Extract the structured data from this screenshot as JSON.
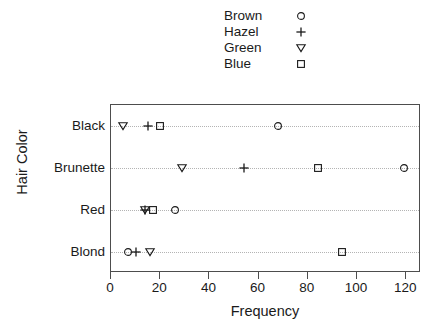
{
  "chart_data": {
    "type": "scatter",
    "title": "",
    "xlabel": "Frequency",
    "ylabel": "Hair Color",
    "xlim": [
      0,
      126
    ],
    "ylim_categories": [
      "Blond",
      "Red",
      "Brunette",
      "Black"
    ],
    "categories": [
      "Black",
      "Brunette",
      "Red",
      "Blond"
    ],
    "xticks": [
      0,
      20,
      40,
      60,
      80,
      100,
      120
    ],
    "grid": "dotted-horizontal",
    "legend_position": "top-center",
    "series": [
      {
        "name": "Brown",
        "marker": "circle",
        "values": [
          68,
          119,
          26,
          7
        ]
      },
      {
        "name": "Hazel",
        "marker": "plus",
        "values": [
          15,
          54,
          14,
          10
        ]
      },
      {
        "name": "Green",
        "marker": "triangle-down",
        "values": [
          5,
          29,
          14,
          16
        ]
      },
      {
        "name": "Blue",
        "marker": "square",
        "values": [
          20,
          84,
          17,
          94
        ]
      }
    ],
    "points": [
      {
        "category": "Black",
        "series": "Green",
        "marker": "triangle-down",
        "x": 5
      },
      {
        "category": "Black",
        "series": "Hazel",
        "marker": "plus",
        "x": 15
      },
      {
        "category": "Black",
        "series": "Blue",
        "marker": "square",
        "x": 20
      },
      {
        "category": "Black",
        "series": "Brown",
        "marker": "circle",
        "x": 68
      },
      {
        "category": "Brunette",
        "series": "Green",
        "marker": "triangle-down",
        "x": 29
      },
      {
        "category": "Brunette",
        "series": "Hazel",
        "marker": "plus",
        "x": 54
      },
      {
        "category": "Brunette",
        "series": "Blue",
        "marker": "square",
        "x": 84
      },
      {
        "category": "Brunette",
        "series": "Brown",
        "marker": "circle",
        "x": 119
      },
      {
        "category": "Red",
        "series": "Green",
        "marker": "triangle-down",
        "x": 14
      },
      {
        "category": "Red",
        "series": "Hazel",
        "marker": "plus",
        "x": 14
      },
      {
        "category": "Red",
        "series": "Blue",
        "marker": "square",
        "x": 17
      },
      {
        "category": "Red",
        "series": "Brown",
        "marker": "circle",
        "x": 26
      },
      {
        "category": "Blond",
        "series": "Brown",
        "marker": "circle",
        "x": 7
      },
      {
        "category": "Blond",
        "series": "Hazel",
        "marker": "plus",
        "x": 10
      },
      {
        "category": "Blond",
        "series": "Green",
        "marker": "triangle-down",
        "x": 16
      },
      {
        "category": "Blond",
        "series": "Blue",
        "marker": "square",
        "x": 94
      }
    ]
  },
  "legend": {
    "items": [
      {
        "label": "Brown",
        "marker": "circle"
      },
      {
        "label": "Hazel",
        "marker": "plus"
      },
      {
        "label": "Green",
        "marker": "triangle-down"
      },
      {
        "label": "Blue",
        "marker": "square"
      }
    ]
  },
  "axes": {
    "x_title": "Frequency",
    "y_title": "Hair Color",
    "x_tick_labels": [
      "0",
      "20",
      "40",
      "60",
      "80",
      "100",
      "120"
    ],
    "y_tick_labels": [
      "Black",
      "Brunette",
      "Red",
      "Blond"
    ]
  },
  "colors": {
    "marker": "#1a1a1a",
    "frame": "#4d4d4d",
    "grid": "#b4b4b4",
    "background": "#ffffff"
  }
}
